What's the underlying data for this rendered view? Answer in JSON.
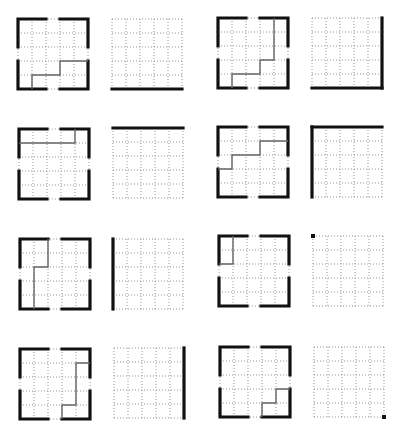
{
  "diagram": {
    "grid_size": 5,
    "colors": {
      "thick": "#111111",
      "path": "#666666",
      "dots": "#8a8a8a"
    },
    "pairs": [
      {
        "left": {
          "x": 18,
          "y": 19,
          "path": [
            [
              1,
              5
            ],
            [
              1,
              4
            ],
            [
              3,
              4
            ],
            [
              3,
              3
            ],
            [
              5,
              3
            ]
          ]
        },
        "right": {
          "x": 112,
          "y": 19,
          "edges": [
            "bottom"
          ],
          "dots": []
        }
      },
      {
        "left": {
          "x": 218,
          "y": 18,
          "path": [
            [
              1,
              5
            ],
            [
              1,
              4
            ],
            [
              3,
              4
            ],
            [
              3,
              3
            ],
            [
              4,
              3
            ],
            [
              4,
              0
            ]
          ]
        },
        "right": {
          "x": 312,
          "y": 18,
          "edges": [
            "right",
            "bottom"
          ],
          "dots": []
        }
      },
      {
        "left": {
          "x": 19,
          "y": 129,
          "path": [
            [
              0,
              1
            ],
            [
              4,
              1
            ],
            [
              4,
              0
            ]
          ]
        },
        "right": {
          "x": 113,
          "y": 128,
          "edges": [
            "top"
          ],
          "dots": []
        }
      },
      {
        "left": {
          "x": 218,
          "y": 127,
          "path": [
            [
              0,
              3
            ],
            [
              1,
              3
            ],
            [
              1,
              2
            ],
            [
              3,
              2
            ],
            [
              3,
              1
            ],
            [
              5,
              1
            ]
          ]
        },
        "right": {
          "x": 312,
          "y": 127,
          "edges": [
            "top",
            "left"
          ],
          "dots": []
        }
      },
      {
        "left": {
          "x": 20,
          "y": 239,
          "path": [
            [
              1,
              5
            ],
            [
              1,
              2
            ],
            [
              2,
              2
            ],
            [
              2,
              0
            ]
          ]
        },
        "right": {
          "x": 113,
          "y": 239,
          "edges": [
            "left"
          ],
          "dots": []
        }
      },
      {
        "left": {
          "x": 219,
          "y": 236,
          "path": [
            [
              1,
              0
            ],
            [
              1,
              2
            ],
            [
              0,
              2
            ]
          ]
        },
        "right": {
          "x": 313,
          "y": 236,
          "edges": [],
          "dots": [
            "top-left"
          ]
        }
      },
      {
        "left": {
          "x": 20,
          "y": 349,
          "path": [
            [
              5,
              1
            ],
            [
              4,
              1
            ],
            [
              4,
              4
            ],
            [
              3,
              4
            ],
            [
              3,
              5
            ]
          ]
        },
        "right": {
          "x": 114,
          "y": 348,
          "edges": [
            "right"
          ],
          "dots": []
        }
      },
      {
        "left": {
          "x": 220,
          "y": 347,
          "path": [
            [
              5,
              3
            ],
            [
              4,
              3
            ],
            [
              4,
              4
            ],
            [
              3,
              4
            ],
            [
              3,
              5
            ]
          ]
        },
        "right": {
          "x": 314,
          "y": 347,
          "edges": [],
          "dots": [
            "bottom-right"
          ]
        }
      }
    ]
  }
}
